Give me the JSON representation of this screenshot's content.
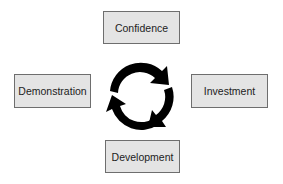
{
  "diagram": {
    "type": "cycle",
    "nodes": [
      {
        "id": "confidence",
        "label": "Confidence",
        "position": "top"
      },
      {
        "id": "investment",
        "label": "Investment",
        "position": "right"
      },
      {
        "id": "development",
        "label": "Development",
        "position": "bottom"
      },
      {
        "id": "demonstration",
        "label": "Demonstration",
        "position": "left"
      }
    ],
    "center_icon": "circular-arrows-icon",
    "colors": {
      "box_fill": "#e4e4e4",
      "box_border": "#6e6e6e",
      "arrow": "#000000"
    }
  }
}
